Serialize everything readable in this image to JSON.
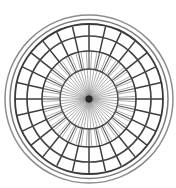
{
  "figure": {
    "title": "Rosette Wheel Diagram",
    "background_color": "#ffffff",
    "canvas": {
      "width": 176,
      "height": 188
    }
  },
  "chart_data": {
    "type": "scatter",
    "title": "Rosette Wheel Diagram",
    "subtitle": "",
    "xlabel": "",
    "ylabel": "",
    "grid": "polar",
    "legend_position": "none",
    "center": {
      "x": 89,
      "y": 99
    },
    "axis_ranges": {
      "radius_min": 0,
      "radius_max": 85,
      "angle_min": 0,
      "angle_max": 360
    },
    "rings": [
      {
        "name": "outer-rim-outer",
        "radius_x": 84,
        "radius_y": 84,
        "stroke": "#8d8d8d",
        "stroke_width": 1.5
      },
      {
        "name": "outer-rim-inner",
        "radius_x": 79,
        "radius_y": 79.5,
        "stroke": "#7a7a7a",
        "stroke_width": 1.5
      },
      {
        "name": "tire-ring",
        "radius_x": 74,
        "radius_y": 75,
        "stroke": "#3a3a3a",
        "stroke_width": 1.8
      },
      {
        "name": "band-outer-ring",
        "radius_x": 62,
        "radius_y": 63,
        "stroke": "#444444",
        "stroke_width": 1.7
      },
      {
        "name": "band-inner-ring",
        "radius_x": 47,
        "radius_y": 48,
        "stroke": "#3f3f3f",
        "stroke_width": 1.6
      },
      {
        "name": "hub-ring",
        "radius_x": 29,
        "radius_y": 30,
        "stroke": "#4a4a4a",
        "stroke_width": 1.4
      }
    ],
    "spoke_sets": [
      {
        "name": "outer-band-dividers",
        "count": 28,
        "inner_radius": 47,
        "outer_radius": 74,
        "stroke": "#3d3d3d",
        "stroke_width": 1.5,
        "angle_offset_deg": 0
      },
      {
        "name": "mid-band-dividers",
        "count": 28,
        "inner_radius": 29,
        "outer_radius": 47,
        "stroke": "#555555",
        "stroke_width": 1.1,
        "angle_offset_deg": 0
      },
      {
        "name": "inner-fan-spokes",
        "count": 56,
        "inner_radius": 2,
        "outer_radius": 47,
        "stroke": "#6e6e6e",
        "stroke_width": 0.55,
        "angle_offset_deg": 3.2
      }
    ],
    "hub": {
      "name": "center-hub",
      "radius": 3.2,
      "fill": "#2b2b2b",
      "stroke": "#1a1a1a"
    },
    "colors": {
      "ink_dark": "#2b2b2b",
      "ink_mid": "#555555",
      "ink_light": "#8d8d8d",
      "background": "#ffffff"
    }
  }
}
